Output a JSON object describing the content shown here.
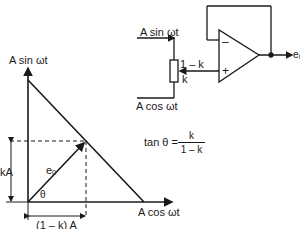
{
  "circuit": {
    "input_sin": "A sin ωt",
    "input_cos": "A cos ωt",
    "pot_upper": "1 – k",
    "pot_lower": "k",
    "inv_input": "–",
    "noninv_input": "+",
    "output": "eᵢ"
  },
  "phasor": {
    "y_axis_label": "A sin ωt",
    "x_axis_label": "A cos ωt",
    "vector_label": "eₒ",
    "angle_label": "θ",
    "vertical_dim": "kA",
    "horizontal_dim": "(1 – k) A"
  },
  "equation": {
    "lhs": "tan θ =",
    "numerator": "k",
    "denominator": "1 – k"
  },
  "colors": {
    "ink": "#1a1a1a",
    "background": "#ffffff"
  }
}
